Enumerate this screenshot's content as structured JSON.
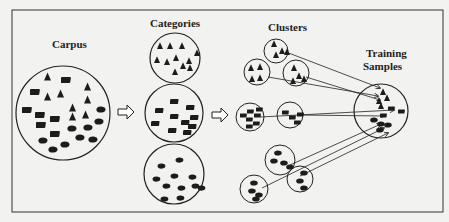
{
  "diagram": {
    "title_labels": {
      "corpus": "Carpus",
      "categories": "Categories",
      "clusters": "Clusters",
      "training_line1": "Training",
      "training_line2": "Samples"
    },
    "stages": [
      "Carpus",
      "Categories",
      "Clusters",
      "Training Samples"
    ],
    "categories": [
      {
        "shape": "triangle",
        "count": 12
      },
      {
        "shape": "rectangle",
        "count": 11
      },
      {
        "shape": "bean",
        "count": 11
      }
    ],
    "clusters": [
      {
        "shape": "triangle",
        "count": 4
      },
      {
        "shape": "triangle",
        "count": 4
      },
      {
        "shape": "triangle",
        "count": 4
      },
      {
        "shape": "rectangle",
        "count": 7
      },
      {
        "shape": "rectangle",
        "count": 4
      },
      {
        "shape": "bean",
        "count": 4
      },
      {
        "shape": "bean",
        "count": 4
      },
      {
        "shape": "bean",
        "count": 3
      }
    ],
    "colors": {
      "background": "#f2f2f0",
      "ink": "#1c1c1c"
    }
  }
}
